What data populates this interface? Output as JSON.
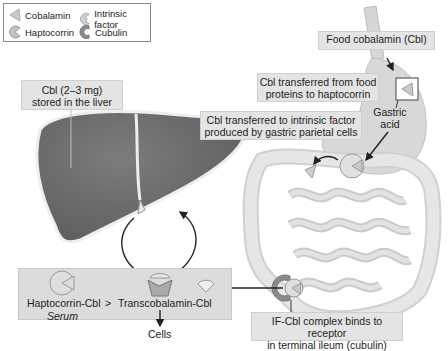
{
  "legend": {
    "items": [
      {
        "icon": "cobalamin-icon",
        "label": "Cobalamin"
      },
      {
        "icon": "intrinsic-factor-icon",
        "label": "Intrinsic factor"
      },
      {
        "icon": "haptocorrin-icon",
        "label": "Haptocorrin"
      },
      {
        "icon": "cubulin-icon",
        "label": "Cubulin"
      }
    ]
  },
  "labels": {
    "liver_storage": [
      "Cbl (2–3 mg)",
      "stored in the liver"
    ],
    "food_cobalamin": "Food cobalamin (Cbl)",
    "transfer_haptocorrin": [
      "Cbl transferred from food",
      "proteins to haptocorrin"
    ],
    "gastric_acid": [
      "Gastric",
      "acid"
    ],
    "transfer_intrinsic_factor": [
      "Cbl transferred to intrinsic factor",
      "produced by gastric parietal cells"
    ],
    "ileum_binding": [
      "IF-Cbl complex binds to receptor",
      "in terminal ileum (cubulin)"
    ],
    "haptocorrin_cbl": "Haptocorrin-Cbl",
    "greater_than": ">",
    "transcobalamin_cbl": "Transcobalamin-Cbl",
    "serum": "Serum",
    "cells": "Cells"
  },
  "colors": {
    "liver": "#6e6e6e",
    "gi_tract": "#d8d8d8",
    "label_bg": "#e4e4e4",
    "protein_fill": "#c8c8c8",
    "cubulin": "#8a8a8a"
  }
}
